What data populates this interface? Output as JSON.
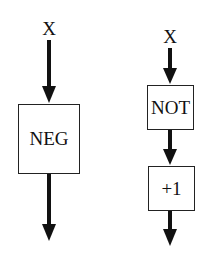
{
  "diagram": {
    "left": {
      "input_label": "X",
      "block_label": "NEG"
    },
    "right": {
      "input_label": "X",
      "block1_label": "NOT",
      "block2_label": "+1"
    }
  }
}
